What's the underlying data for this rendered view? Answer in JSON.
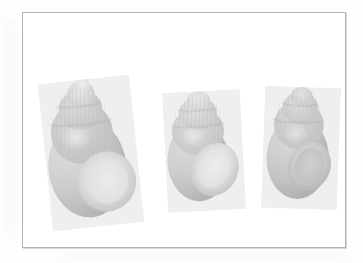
{
  "figure": {
    "medium": "halftone-print-scan",
    "background_color": "#fefefe",
    "frame": {
      "border_color": "#b4b4b4",
      "fill_color": "#ffffff",
      "x": 22,
      "y": 12,
      "width": 324,
      "height": 236
    },
    "caption": "",
    "specimens": [
      {
        "position": "left",
        "orientation": "apertural-view-tilted",
        "aperture_visible": true,
        "aperture_tone": "light",
        "relative_size": "largest",
        "tone": "mid-gray"
      },
      {
        "position": "center",
        "orientation": "apertural-view",
        "aperture_visible": true,
        "aperture_tone": "light",
        "relative_size": "smallest",
        "tone": "mid-gray"
      },
      {
        "position": "right",
        "orientation": "apertural-view",
        "aperture_visible": true,
        "aperture_tone": "dark",
        "relative_size": "medium",
        "tone": "dark-gray"
      }
    ]
  }
}
